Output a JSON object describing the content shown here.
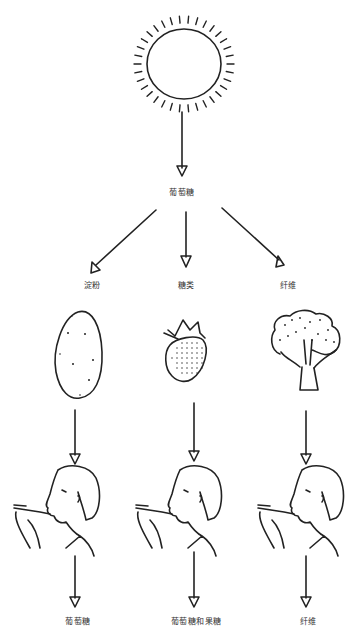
{
  "diagram": {
    "source": {
      "name": "sun",
      "label": ""
    },
    "root_label": "葡萄糖",
    "branches": [
      {
        "food_type_label": "淀粉",
        "food": "potato",
        "result_label": "葡萄糖",
        "x": 88
      },
      {
        "food_type_label": "糖类",
        "food": "strawberry",
        "result_label": "葡萄糖和果糖",
        "x": 185
      },
      {
        "food_type_label": "纤维",
        "food": "broccoli",
        "result_label": "纤维",
        "x": 298
      }
    ]
  },
  "colors": {
    "line": "#222222",
    "label": "#333333",
    "background": "#ffffff"
  }
}
